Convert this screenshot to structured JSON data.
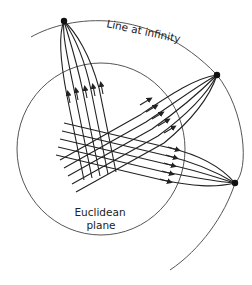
{
  "diagram": {
    "labels": {
      "line_at_infinity": "Line at infinity",
      "euclidean_line1": "Euclidean",
      "euclidean_line2": "plane"
    },
    "colors": {
      "stroke": "#222222",
      "thin_stroke": "#555555",
      "background": "#ffffff"
    },
    "points_at_infinity": [
      {
        "id": "A",
        "x": 64,
        "y": 21
      },
      {
        "id": "B",
        "x": 217,
        "y": 75
      },
      {
        "id": "C",
        "x": 235,
        "y": 183
      }
    ],
    "line_families": [
      {
        "converges_to": "A",
        "count": 5,
        "direction": "up"
      },
      {
        "converges_to": "B",
        "count": 5,
        "direction": "upper-right"
      },
      {
        "converges_to": "C",
        "count": 5,
        "direction": "right"
      }
    ]
  }
}
